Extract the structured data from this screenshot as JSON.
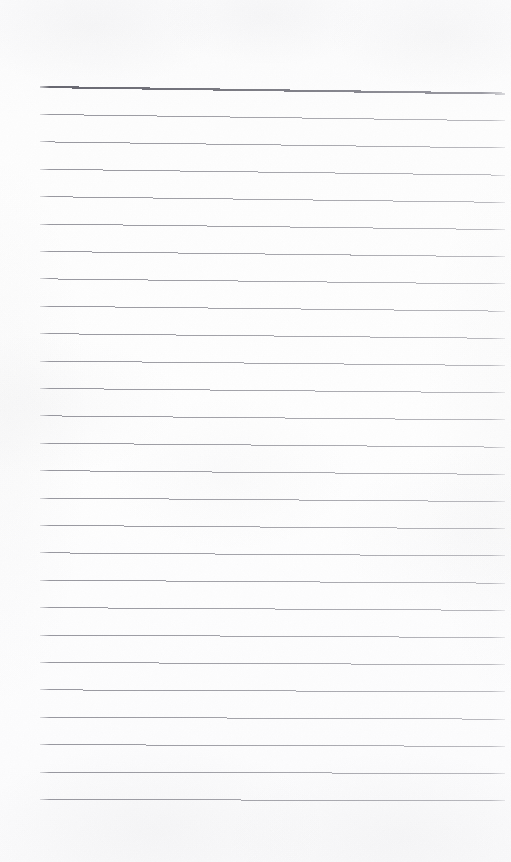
{
  "document": {
    "kind": "scanned-ruled-notepad-page",
    "orientation": "portrait",
    "page_width_px": 511,
    "page_height_px": 862,
    "visible_text": "",
    "handwriting_present": false,
    "printed_text_present": false,
    "description": "Blank lined notepad page, scanned. No text, no handwriting, no headings, no page number, no marginalia."
  },
  "colors": {
    "page_background": "#fdfdfd",
    "paper_tint": "#fbfbfc",
    "rule_line": "#8a8a92",
    "header_rule_line": "#6f6f78",
    "scan_shadow": "#969698"
  },
  "ruling": {
    "line_count": 27,
    "first_line_y": 87,
    "line_spacing_px": 27.3,
    "left_margin_x": 40,
    "right_margin_x": 505,
    "skew_drop_px": 6,
    "header_rule_index": 0,
    "header_rule_thickness_px": 2.1,
    "body_rule_thickness_px": 0.9,
    "top_blank_margin_px": 87,
    "bottom_blank_margin_px": 56,
    "lines": [
      {
        "index": 0,
        "y_left": 87.0,
        "y_right": 93.6,
        "weight": "header"
      },
      {
        "index": 1,
        "y_left": 114.4,
        "y_right": 120.8,
        "weight": "body"
      },
      {
        "index": 2,
        "y_left": 141.8,
        "y_right": 148.0,
        "weight": "body"
      },
      {
        "index": 3,
        "y_left": 169.2,
        "y_right": 175.2,
        "weight": "body"
      },
      {
        "index": 4,
        "y_left": 196.6,
        "y_right": 202.4,
        "weight": "body"
      },
      {
        "index": 5,
        "y_left": 224.0,
        "y_right": 229.6,
        "weight": "body"
      },
      {
        "index": 6,
        "y_left": 251.4,
        "y_right": 256.8,
        "weight": "body"
      },
      {
        "index": 7,
        "y_left": 278.8,
        "y_right": 284.0,
        "weight": "body"
      },
      {
        "index": 8,
        "y_left": 306.2,
        "y_right": 311.2,
        "weight": "body"
      },
      {
        "index": 9,
        "y_left": 333.6,
        "y_right": 338.4,
        "weight": "body"
      },
      {
        "index": 10,
        "y_left": 361.0,
        "y_right": 365.6,
        "weight": "body"
      },
      {
        "index": 11,
        "y_left": 388.4,
        "y_right": 392.8,
        "weight": "body"
      },
      {
        "index": 12,
        "y_left": 415.8,
        "y_right": 420.0,
        "weight": "body"
      },
      {
        "index": 13,
        "y_left": 443.2,
        "y_right": 447.2,
        "weight": "body"
      },
      {
        "index": 14,
        "y_left": 470.6,
        "y_right": 474.4,
        "weight": "body"
      },
      {
        "index": 15,
        "y_left": 498.0,
        "y_right": 501.6,
        "weight": "body"
      },
      {
        "index": 16,
        "y_left": 525.4,
        "y_right": 528.8,
        "weight": "body"
      },
      {
        "index": 17,
        "y_left": 552.8,
        "y_right": 556.0,
        "weight": "body"
      },
      {
        "index": 18,
        "y_left": 580.2,
        "y_right": 583.2,
        "weight": "body"
      },
      {
        "index": 19,
        "y_left": 607.6,
        "y_right": 610.4,
        "weight": "body"
      },
      {
        "index": 20,
        "y_left": 635.0,
        "y_right": 637.6,
        "weight": "body"
      },
      {
        "index": 21,
        "y_left": 662.4,
        "y_right": 664.8,
        "weight": "body"
      },
      {
        "index": 22,
        "y_left": 689.8,
        "y_right": 692.0,
        "weight": "body"
      },
      {
        "index": 23,
        "y_left": 717.2,
        "y_right": 719.2,
        "weight": "body"
      },
      {
        "index": 24,
        "y_left": 744.6,
        "y_right": 746.4,
        "weight": "body"
      },
      {
        "index": 25,
        "y_left": 772.0,
        "y_right": 773.6,
        "weight": "body"
      },
      {
        "index": 26,
        "y_left": 799.4,
        "y_right": 800.8,
        "weight": "body"
      }
    ]
  }
}
